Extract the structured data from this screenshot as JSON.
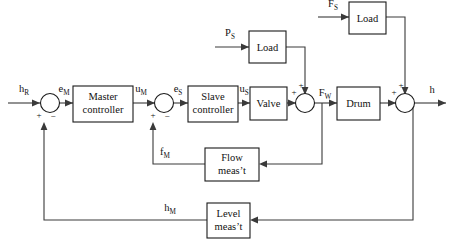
{
  "diagram": {
    "colors": {
      "background": "#ffffff",
      "line": "#3a3a3a",
      "block_stroke": "#1a1a1a",
      "text": "#111111"
    },
    "blocks": [
      {
        "id": "master_controller",
        "label_line1": "Master",
        "label_line2": "controller"
      },
      {
        "id": "slave_controller",
        "label_line1": "Slave",
        "label_line2": "controller"
      },
      {
        "id": "valve",
        "label_line1": "Valve",
        "label_line2": ""
      },
      {
        "id": "drum",
        "label_line1": "Drum",
        "label_line2": ""
      },
      {
        "id": "load_pressure",
        "label_line1": "Load",
        "label_line2": ""
      },
      {
        "id": "load_flow",
        "label_line1": "Load",
        "label_line2": ""
      },
      {
        "id": "flow_measurement",
        "label_line1": "Flow",
        "label_line2": "meas’t"
      },
      {
        "id": "level_measurement",
        "label_line1": "Level",
        "label_line2": "meas’t"
      }
    ],
    "signals": [
      {
        "id": "h_ref",
        "base": "h",
        "sub": "R"
      },
      {
        "id": "error_master",
        "base": "e",
        "sub": "M"
      },
      {
        "id": "u_master",
        "base": "u",
        "sub": "M"
      },
      {
        "id": "error_slave",
        "base": "e",
        "sub": "S"
      },
      {
        "id": "u_slave",
        "base": "u",
        "sub": "S"
      },
      {
        "id": "flow_water",
        "base": "F",
        "sub": "W"
      },
      {
        "id": "level_out",
        "base": "h",
        "sub": ""
      },
      {
        "id": "flow_measured",
        "base": "f",
        "sub": "M"
      },
      {
        "id": "level_measured",
        "base": "h",
        "sub": "M"
      },
      {
        "id": "pressure_steam",
        "base": "P",
        "sub": "S"
      },
      {
        "id": "flow_steam",
        "base": "F",
        "sub": "S"
      }
    ],
    "summing_junctions": [
      {
        "id": "sum_master",
        "sign_left": "+",
        "sign_bottom": "−"
      },
      {
        "id": "sum_slave",
        "sign_left": "+",
        "sign_bottom": "−"
      },
      {
        "id": "sum_flow",
        "sign_left": "+",
        "sign_top": "+"
      },
      {
        "id": "sum_level",
        "sign_left": "+",
        "sign_top": "+"
      }
    ]
  }
}
